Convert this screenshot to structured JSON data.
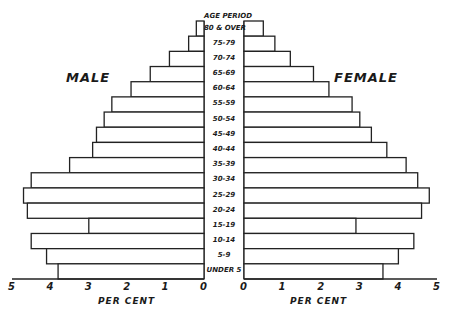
{
  "chart_data": {
    "type": "bar",
    "subtype": "population-pyramid",
    "title": "",
    "center_header": "AGE PERIOD",
    "left_label": "MALE",
    "right_label": "FEMALE",
    "xlabel_left": "PER CENT",
    "xlabel_right": "PER CENT",
    "categories": [
      "80 & OVER",
      "75-79",
      "70-74",
      "65-69",
      "60-64",
      "55-59",
      "50-54",
      "45-49",
      "40-44",
      "35-39",
      "30-34",
      "25-29",
      "20-24",
      "15-19",
      "10-14",
      "5-9",
      "UNDER 5"
    ],
    "series": [
      {
        "name": "MALE",
        "values": [
          0.2,
          0.4,
          0.9,
          1.4,
          1.9,
          2.4,
          2.6,
          2.8,
          2.9,
          3.5,
          4.5,
          4.7,
          4.6,
          3.0,
          4.5,
          4.1,
          3.8
        ]
      },
      {
        "name": "FEMALE",
        "values": [
          0.5,
          0.8,
          1.2,
          1.8,
          2.2,
          2.8,
          3.0,
          3.3,
          3.7,
          4.2,
          4.5,
          4.8,
          4.6,
          2.9,
          4.4,
          4.0,
          3.6
        ]
      }
    ],
    "xticks_left": [
      "5",
      "4",
      "3",
      "2",
      "1",
      "0"
    ],
    "xticks_right": [
      "0",
      "1",
      "2",
      "3",
      "4",
      "5"
    ],
    "xlim": [
      0,
      5
    ],
    "grid": false,
    "legend": "none"
  }
}
